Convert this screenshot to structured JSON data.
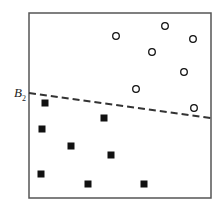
{
  "diagram": {
    "frame": {
      "x": 29,
      "y": 13,
      "width": 182,
      "height": 185,
      "stroke": "#555555"
    },
    "boundary": {
      "label_main": "B",
      "label_sub": "2",
      "x1": 29,
      "y1": 93,
      "x2": 211,
      "y2": 118,
      "style": "dashed",
      "color": "#333333"
    },
    "circles": [
      {
        "x": 116,
        "y": 36
      },
      {
        "x": 165,
        "y": 26
      },
      {
        "x": 193,
        "y": 39
      },
      {
        "x": 152,
        "y": 52
      },
      {
        "x": 184,
        "y": 72
      },
      {
        "x": 136,
        "y": 89
      },
      {
        "x": 194,
        "y": 108
      }
    ],
    "squares": [
      {
        "x": 45,
        "y": 103
      },
      {
        "x": 104,
        "y": 118
      },
      {
        "x": 42,
        "y": 129
      },
      {
        "x": 71,
        "y": 146
      },
      {
        "x": 111,
        "y": 155
      },
      {
        "x": 41,
        "y": 174
      },
      {
        "x": 88,
        "y": 184
      },
      {
        "x": 144,
        "y": 184
      }
    ],
    "marker_color": "#111111"
  }
}
